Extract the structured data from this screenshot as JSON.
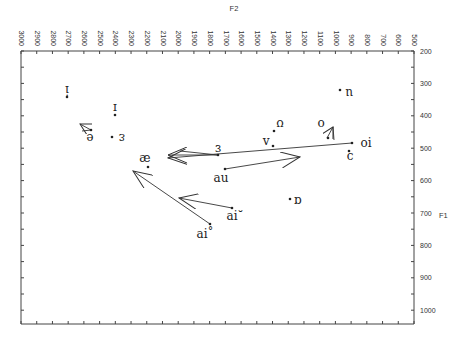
{
  "chart_data": {
    "type": "scatter",
    "title": "",
    "xlabel": "F2",
    "ylabel": "F1",
    "x_axis": {
      "position": "top",
      "reversed": true,
      "range": [
        3000,
        500
      ],
      "ticks": [
        3000,
        2900,
        2800,
        2700,
        2600,
        2500,
        2400,
        2300,
        2200,
        2100,
        2000,
        1900,
        1800,
        1700,
        1600,
        1500,
        1400,
        1300,
        1200,
        1100,
        1000,
        900,
        800,
        700,
        600,
        500
      ]
    },
    "y_axis": {
      "position": "right",
      "reversed": true,
      "range": [
        200,
        1040
      ],
      "ticks": [
        200,
        300,
        400,
        500,
        600,
        700,
        800,
        900,
        1000
      ]
    },
    "grid": false,
    "legend": null,
    "monophthongs": [
      {
        "label": "i",
        "F2": 2710,
        "F1": 335
      },
      {
        "label": "ɪ",
        "F2": 2400,
        "F1": 400
      },
      {
        "label": "e",
        "F2": 2560,
        "F1": 445
      },
      {
        "label": "ɛ",
        "F2": 2420,
        "F1": 465
      },
      {
        "label": "æ",
        "F2": 2190,
        "F1": 550
      },
      {
        "label": "ɜ",
        "F2": 1745,
        "F1": 520
      },
      {
        "label": "ʌ",
        "F2": 1400,
        "F1": 490
      },
      {
        "label": "ʊ",
        "F2": 1390,
        "F1": 445
      },
      {
        "label": "u",
        "F2": 970,
        "F1": 320
      },
      {
        "label": "o",
        "F2": 1055,
        "F1": 470
      },
      {
        "label": "ɔ",
        "F2": 915,
        "F1": 510
      },
      {
        "label": "ɑ",
        "F2": 1230,
        "F1": 660
      }
    ],
    "trajectories": [
      {
        "label": "e",
        "from": {
          "F2": 2560,
          "F1": 445
        },
        "to": {
          "F2": 2500,
          "F1": 420
        }
      },
      {
        "label": "ɜ",
        "from": {
          "F2": 1745,
          "F1": 520
        },
        "to": {
          "F2": 2060,
          "F1": 520
        }
      },
      {
        "label": "o",
        "from": {
          "F2": 1055,
          "F1": 470
        },
        "to": {
          "F2": 1010,
          "F1": 425
        }
      },
      {
        "label": "oi",
        "from": {
          "F2": 895,
          "F1": 490
        },
        "to": {
          "F2": 2060,
          "F1": 530
        }
      },
      {
        "label": "au",
        "from": {
          "F2": 1700,
          "F1": 570
        },
        "to": {
          "F2": 1230,
          "F1": 535
        }
      },
      {
        "label": "ai˘",
        "from": {
          "F2": 1660,
          "F1": 685
        },
        "to": {
          "F2": 2000,
          "F1": 655
        }
      },
      {
        "label": "ai˚",
        "from": {
          "F2": 1790,
          "F1": 735
        },
        "to": {
          "F2": 2290,
          "F1": 570
        }
      }
    ]
  },
  "axes": {
    "x_title": "F2",
    "y_title": "F1",
    "x_tick_labels": [
      "3000",
      "2900",
      "2800",
      "2700",
      "2600",
      "2500",
      "2400",
      "2300",
      "2200",
      "2100",
      "2000",
      "1900",
      "1800",
      "1700",
      "1600",
      "1500",
      "1400",
      "1300",
      "1200",
      "1100",
      "1000",
      "900",
      "800",
      "700",
      "600",
      "500"
    ],
    "y_tick_labels": [
      "200",
      "300",
      "400",
      "500",
      "600",
      "700",
      "800",
      "900",
      "1000"
    ]
  },
  "labels": {
    "i": "i",
    "ih": "ɪ",
    "e": "e",
    "eh": "ɛ",
    "ae": "æ",
    "er": "ɜ",
    "uh": "ʌ",
    "uh2": "ʊ",
    "u": "u",
    "o": "o",
    "oi": "oi",
    "aw": "ɔ",
    "au": "au",
    "aa": "ɑ",
    "ai_short": "ai˘",
    "ai_ring": "ai˚"
  }
}
